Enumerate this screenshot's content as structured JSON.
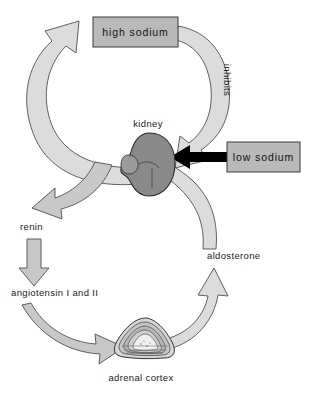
{
  "diagram": {
    "nodes": {
      "high_sodium": "high sodium",
      "low_sodium": "low sodium",
      "kidney": "kidney",
      "renin": "renin",
      "angiotensin": "angiotensin I and II",
      "adrenal_cortex": "adrenal cortex",
      "aldosterone": "aldosterone",
      "inhibits": "inhibits"
    },
    "colors": {
      "box_fill": "#b9b9b9",
      "box_stroke": "#3a3a3a",
      "arrow_light": "#dcdcdc",
      "arrow_mid": "#c8c8c8",
      "arrow_stroke": "#4f4f4f",
      "kidney_fill": "#8a8a8a",
      "kidney_stroke": "#2f2f2f",
      "black_arrow": "#000000",
      "adrenal_fill": "#cfcfcf",
      "text": "#1a1a1a",
      "background": "#ffffff"
    },
    "edges": [
      {
        "from": "kidney",
        "to": "renin",
        "label": "renin"
      },
      {
        "from": "renin",
        "to": "angiotensin",
        "label": "angiotensin I and II"
      },
      {
        "from": "angiotensin",
        "to": "adrenal_cortex",
        "label": ""
      },
      {
        "from": "adrenal_cortex",
        "to": "kidney",
        "label": "aldosterone"
      },
      {
        "from": "kidney",
        "to": "high_sodium",
        "label": ""
      },
      {
        "from": "high_sodium",
        "to": "kidney",
        "label": "inhibits"
      },
      {
        "from": "low_sodium",
        "to": "kidney",
        "label": ""
      }
    ]
  }
}
